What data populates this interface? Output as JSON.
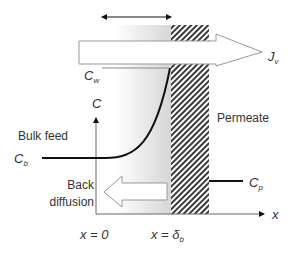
{
  "diagram": {
    "labels": {
      "flux": "J",
      "flux_sub": "v",
      "wall_conc": "C",
      "wall_conc_sub": "w",
      "conc_axis": "C",
      "bulk_feed": "Bulk feed",
      "bulk_conc": "C",
      "bulk_conc_sub": "b",
      "permeate": "Permeate",
      "permeate_conc": "C",
      "permeate_conc_sub": "p",
      "back_diffusion_line1": "Back",
      "back_diffusion_line2": "diffusion",
      "x_axis": "x",
      "x_origin": "x = 0",
      "x_boundary": "x = δ",
      "x_boundary_sub": "b"
    },
    "colors": {
      "line": "#111111",
      "outline": "#999999",
      "hatch": "#444444",
      "gradient_start": "#ffffff",
      "gradient_end": "#d9d9d9",
      "text": "#333333"
    }
  }
}
